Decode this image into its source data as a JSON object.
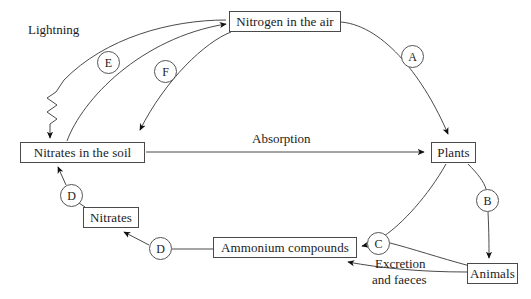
{
  "diagram": {
    "stroke_color": "#4a4a4a",
    "text_color": "#1b1b1b",
    "background": "#ffffff"
  },
  "boxes": [
    {
      "id": "nitrogen-in-the-air",
      "label": "Nitrogen in the air",
      "x": 229,
      "y": 11,
      "w": 112,
      "h": 21
    },
    {
      "id": "nitrates-in-the-soil",
      "label": "Nitrates in the soil",
      "x": 20,
      "y": 142,
      "w": 125,
      "h": 21
    },
    {
      "id": "plants",
      "label": "Plants",
      "x": 431,
      "y": 142,
      "w": 45,
      "h": 21
    },
    {
      "id": "animals",
      "label": "Animals",
      "x": 467,
      "y": 263,
      "w": 51,
      "h": 21
    },
    {
      "id": "ammonium-compounds",
      "label": "Ammonium compounds",
      "x": 213,
      "y": 237,
      "w": 144,
      "h": 21
    },
    {
      "id": "nitrates",
      "label": "Nitrates",
      "x": 83,
      "y": 207,
      "w": 56,
      "h": 21
    }
  ],
  "circles": [
    {
      "id": "stage-a",
      "label": "A",
      "cx": 412,
      "cy": 56
    },
    {
      "id": "stage-b",
      "label": "B",
      "cx": 487,
      "cy": 200
    },
    {
      "id": "stage-c",
      "label": "C",
      "cx": 378,
      "cy": 243
    },
    {
      "id": "stage-d-soil",
      "label": "D",
      "cx": 71,
      "cy": 195
    },
    {
      "id": "stage-d-ammonium",
      "label": "D",
      "cx": 160,
      "cy": 248
    },
    {
      "id": "stage-e",
      "label": "E",
      "cx": 108,
      "cy": 62
    },
    {
      "id": "stage-f",
      "label": "F",
      "cx": 165,
      "cy": 71
    }
  ],
  "labels": [
    {
      "id": "lightning",
      "text": "Lightning",
      "x": 28,
      "y": 22
    },
    {
      "id": "absorption",
      "text": "Absorption",
      "x": 252,
      "y": 131
    },
    {
      "id": "excretion-line-1",
      "text": "Excretion",
      "x": 375,
      "y": 256
    },
    {
      "id": "excretion-line-2",
      "text": "and faeces",
      "x": 372,
      "y": 272
    }
  ]
}
